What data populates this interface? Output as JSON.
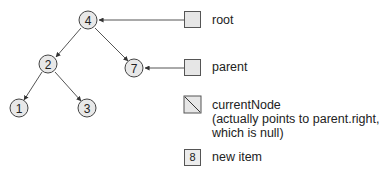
{
  "tree": {
    "nodes": [
      {
        "id": "n4",
        "label": "4",
        "cx": 88,
        "cy": 20
      },
      {
        "id": "n2",
        "label": "2",
        "cx": 48,
        "cy": 64
      },
      {
        "id": "n7",
        "label": "7",
        "cx": 134,
        "cy": 68
      },
      {
        "id": "n1",
        "label": "1",
        "cx": 19,
        "cy": 108
      },
      {
        "id": "n3",
        "label": "3",
        "cx": 87,
        "cy": 108
      }
    ],
    "edges": [
      {
        "from": "n4",
        "to": "n2"
      },
      {
        "from": "n4",
        "to": "n7"
      },
      {
        "from": "n2",
        "to": "n1"
      },
      {
        "from": "n2",
        "to": "n3"
      }
    ]
  },
  "legend": {
    "root": {
      "label": "root"
    },
    "parent": {
      "label": "parent"
    },
    "currentNode": {
      "label": "currentNode",
      "note_line1": "(actually points to parent.right,",
      "note_line2": "which is null)"
    },
    "new_item": {
      "value": "8",
      "label": "new item"
    }
  },
  "colors": {
    "node_fill": "#e8e8e8",
    "stroke": "#444444",
    "text": "#222222"
  }
}
